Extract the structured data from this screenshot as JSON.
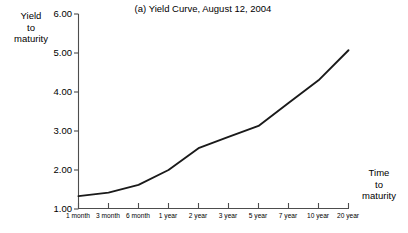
{
  "chart_data": {
    "type": "line",
    "title": "(a) Yield Curve, August 12, 2004",
    "xlabel": "Time to maturity",
    "ylabel": "Yield to maturity",
    "categories": [
      "1 month",
      "3 month",
      "6 month",
      "1 year",
      "2 year",
      "3 year",
      "5 year",
      "7 year",
      "10 year",
      "20 year"
    ],
    "values": [
      1.33,
      1.42,
      1.62,
      2.0,
      2.56,
      2.85,
      3.13,
      3.72,
      4.3,
      5.07
    ],
    "series": [
      {
        "name": "Yield to maturity",
        "values": [
          1.33,
          1.42,
          1.62,
          2.0,
          2.56,
          2.85,
          3.13,
          3.72,
          4.3,
          5.07
        ]
      }
    ],
    "ylim": [
      1.0,
      6.0
    ],
    "yticks": [
      1.0,
      2.0,
      3.0,
      4.0,
      5.0,
      6.0
    ],
    "ytick_labels": [
      "1.00",
      "2.00",
      "3.00",
      "4.00",
      "5.00",
      "6.00"
    ],
    "grid": false,
    "legend": "none",
    "line_color": "#1a1a1a",
    "axis_color": "#4d4d4d"
  },
  "figure": {
    "title": "(a) Yield Curve, August 12, 2004",
    "y_axis_caption": {
      "line1": "Yield",
      "line2": "to",
      "line3": "maturity"
    },
    "x_axis_caption": {
      "line1": "Time",
      "line2": "to",
      "line3": "maturity"
    },
    "y_tick_labels": [
      "6.00",
      "5.00",
      "4.00",
      "3.00",
      "2.00",
      "1.00"
    ],
    "x_tick_labels": [
      "1 month",
      "3 month",
      "6 month",
      "1 year",
      "2 year",
      "3 year",
      "5 year",
      "7 year",
      "10 year",
      "20 year"
    ]
  }
}
